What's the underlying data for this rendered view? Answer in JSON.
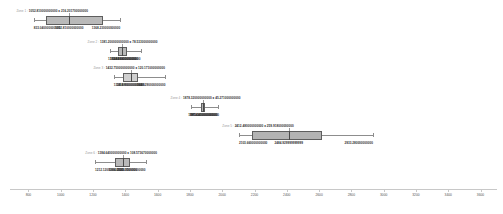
{
  "chart_data": {
    "type": "boxplot",
    "title": "",
    "xlabel": "",
    "ylabel": "",
    "xlim": [
      760,
      3640
    ],
    "grid": false,
    "legend": "none",
    "orientation": "horizontal",
    "axis": {
      "ticks": [
        800,
        1000,
        1200,
        1400,
        1600,
        1800,
        2000,
        2200,
        2400,
        2600,
        2800,
        3000,
        3200,
        3400,
        3600
      ],
      "tick_labels": [
        "800",
        "1000",
        "1200",
        "1400",
        "1600",
        "1800",
        "2000",
        "2200",
        "2400",
        "2600",
        "2800",
        "3000",
        "3200",
        "3400",
        "3600"
      ]
    },
    "groups": [
      {
        "name": "Zone 1",
        "tag": "Zone 1 :",
        "stat": "1052.810000000000 ± 216.201700000000",
        "title": "Zone 1 : 1052.810000000000 ± 216.201700000000",
        "mean": 1052.81,
        "std": 216.2017,
        "whisker_low": 833.04,
        "q1": 911.0,
        "median": 1052.81,
        "q3": 1262.0,
        "whisker_high": 1368.23,
        "label_lower": "833.040000000000",
        "label_center": "1052.810000000000",
        "label_upper": "1368.230000000000",
        "box_shade": "medium"
      },
      {
        "name": "Zone 2",
        "tag": "Zone 2 :",
        "stat": "1381.200000000000 ± 78.533000000000",
        "title": "Zone 2 : 1381.200000000000 ± 78.533000000000",
        "mean": 1381.2,
        "std": 78.533,
        "whisker_low": 1304.28,
        "q1": 1352.0,
        "median": 1381.2,
        "q3": 1412.0,
        "whisker_high": 1494.04,
        "label_lower": "1304.280000000000",
        "label_center": "1382.890000000000",
        "label_upper": "1494.040000000000",
        "box_shade": "medium"
      },
      {
        "name": "Zone 3",
        "tag": "Zone 3 :",
        "stat": "1432.750000000000 ± 120.171000000000",
        "title": "Zone 3 : 1432.750000000000 ± 120.171000000000",
        "mean": 1432.75,
        "std": 120.171,
        "whisker_low": 1328.98,
        "q1": 1388.0,
        "median": 1432.75,
        "q3": 1478.0,
        "whisker_high": 1648.29,
        "label_lower": "1328.980000000000",
        "label_center": "1434.900000000000",
        "label_upper": "1648.290000000000",
        "box_shade": "light"
      },
      {
        "name": "Zone 4",
        "tag": "Zone 4 :",
        "stat": "1878.320000000000 ± 45.271000000000",
        "title": "Zone 4 : 1878.320000000000 ± 45.271000000000",
        "mean": 1878.32,
        "std": 45.271,
        "whisker_low": 1804.01,
        "q1": 1866.0,
        "median": 1878.32,
        "q3": 1896.0,
        "whisker_high": 1972.54,
        "label_lower": "1804.010000000000",
        "label_center": "1881.640000000000",
        "label_upper": "1972.540000000000",
        "box_shade": "dark"
      },
      {
        "name": "Zone 5",
        "tag": "Zone 5 :",
        "stat": "2412.480000000000 ± 259.918000000000",
        "title": "Zone 5 : 2412.480000000000 ± 259.918000000000",
        "mean": 2412.48,
        "std": 259.918,
        "whisker_low": 2103.66,
        "q1": 2186.0,
        "median": 2412.48,
        "q3": 2619.0,
        "whisker_high": 2933.28,
        "label_lower": "2103.660000000000",
        "label_center": "2484.929999999999",
        "label_upper": "2933.280000000000",
        "box_shade": "dark"
      },
      {
        "name": "Zone 6",
        "tag": "Zone 6 :",
        "stat": "1384.640000000000 ± 108.573670000000",
        "title": "Zone 6 : 1384.640000000000 ± 108.573670000000",
        "mean": 1384.64,
        "std": 108.57367,
        "whisker_low": 1212.12,
        "q1": 1338.0,
        "median": 1384.64,
        "q3": 1432.0,
        "whisker_high": 1525.35,
        "label_lower": "1212.120000000000",
        "label_center": "1384.250000000000",
        "label_upper": "1525.350000000000",
        "box_shade": "medium"
      }
    ]
  }
}
